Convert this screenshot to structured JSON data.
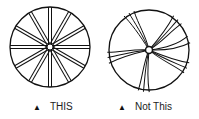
{
  "figures": [
    {
      "caption": "THIS",
      "marker": "▲",
      "style": "straight-spokes"
    },
    {
      "caption": "Not This",
      "marker": "▲",
      "style": "curved-spokes"
    }
  ],
  "colors": {
    "stroke": "#111111",
    "background": "#ffffff"
  }
}
